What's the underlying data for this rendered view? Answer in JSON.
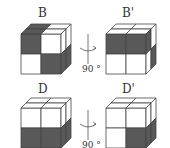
{
  "figure": {
    "rows": [
      {
        "left_label": "B",
        "right_label": "B'",
        "rotation_label": "90 °",
        "left_cube": {
          "front": [
            [
              "dark",
              "white"
            ],
            [
              "white",
              "dark"
            ]
          ],
          "top": [
            [
              "dark",
              "white"
            ],
            [
              "dark",
              "white"
            ]
          ],
          "right": [
            [
              "white",
              "white"
            ],
            [
              "dark",
              "dark"
            ]
          ]
        },
        "right_cube": {
          "front": [
            [
              "dark",
              "dark"
            ],
            [
              "white",
              "white"
            ]
          ],
          "top": [
            [
              "white",
              "white"
            ],
            [
              "white",
              "white"
            ]
          ],
          "right": [
            [
              "dark",
              "white"
            ],
            [
              "white",
              "dark"
            ]
          ]
        }
      },
      {
        "left_label": "D",
        "right_label": "D'",
        "rotation_label": "90 °",
        "left_cube": {
          "front": [
            [
              "white",
              "white"
            ],
            [
              "dark",
              "dark"
            ]
          ],
          "top": [
            [
              "white",
              "white"
            ],
            [
              "white",
              "white"
            ]
          ],
          "right": [
            [
              "white",
              "white"
            ],
            [
              "dark",
              "dark"
            ]
          ]
        },
        "right_cube": {
          "front": [
            [
              "white",
              "white"
            ],
            [
              "white",
              "dark"
            ]
          ],
          "top": [
            [
              "white",
              "white"
            ],
            [
              "white",
              "white"
            ]
          ],
          "right": [
            [
              "white",
              "white"
            ],
            [
              "dark",
              "dark"
            ]
          ]
        }
      }
    ],
    "colors": {
      "dark": "#595959",
      "white": "#ffffff",
      "edge": "#444444"
    }
  }
}
